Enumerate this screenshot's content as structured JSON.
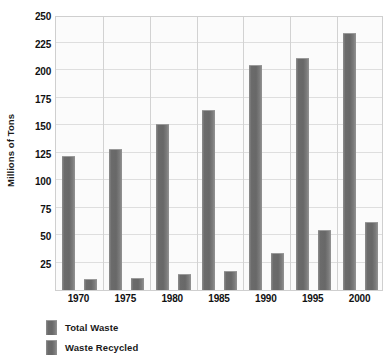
{
  "chart_data": {
    "type": "bar",
    "title": "",
    "xlabel": "",
    "ylabel": "Millions of Tons",
    "categories": [
      "1970",
      "1975",
      "1980",
      "1985",
      "1990",
      "1995",
      "2000"
    ],
    "series": [
      {
        "name": "Total Waste",
        "values": [
          122,
          128,
          151,
          164,
          205,
          211,
          234
        ]
      },
      {
        "name": "Waste Recycled",
        "values": [
          10,
          11,
          15,
          17,
          34,
          55,
          62
        ]
      }
    ],
    "ylim": [
      0,
      250
    ],
    "yticks": [
      0,
      25,
      50,
      75,
      100,
      125,
      150,
      175,
      200,
      225,
      250
    ],
    "ytick_labels": [
      "",
      "25",
      "50",
      "75",
      "100",
      "125",
      "150",
      "175",
      "200",
      "225",
      "250"
    ],
    "grid": true,
    "legend_position": "bottom-left",
    "bar_color": "#6e6e6e",
    "plot_background": "#fbfbfb",
    "gridline_color": "#dedede"
  }
}
